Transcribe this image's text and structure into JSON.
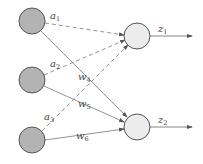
{
  "diagram": {
    "type": "neural-network",
    "colors": {
      "input_fill": "#b3b3b3",
      "output_fill": "#ececec",
      "stroke": "#555555",
      "edge": "#666666"
    },
    "input_nodes": [
      {
        "id": "x1",
        "cx": 32,
        "cy": 21
      },
      {
        "id": "x2",
        "cx": 32,
        "cy": 80
      },
      {
        "id": "x3",
        "cx": 32,
        "cy": 140
      }
    ],
    "output_nodes": [
      {
        "id": "z1",
        "cx": 137,
        "cy": 36
      },
      {
        "id": "z2",
        "cx": 137,
        "cy": 127
      }
    ],
    "edges": [
      {
        "from": "x1",
        "to": "z1",
        "style": "dashed",
        "label": {
          "base": "a",
          "sub": "1"
        }
      },
      {
        "from": "x2",
        "to": "z1",
        "style": "dashed",
        "label": {
          "base": "a",
          "sub": "2"
        }
      },
      {
        "from": "x3",
        "to": "z1",
        "style": "dashed",
        "label": {
          "base": "a",
          "sub": "3"
        }
      },
      {
        "from": "x1",
        "to": "z2",
        "style": "solid",
        "label": {
          "base": "w",
          "sub": "4"
        }
      },
      {
        "from": "x2",
        "to": "z2",
        "style": "solid",
        "label": {
          "base": "w",
          "sub": "5"
        }
      },
      {
        "from": "x3",
        "to": "z2",
        "style": "solid",
        "label": {
          "base": "w",
          "sub": "6"
        }
      }
    ],
    "outputs": [
      {
        "label": {
          "base": "z",
          "sub": "1"
        }
      },
      {
        "label": {
          "base": "z",
          "sub": "2"
        }
      }
    ]
  }
}
